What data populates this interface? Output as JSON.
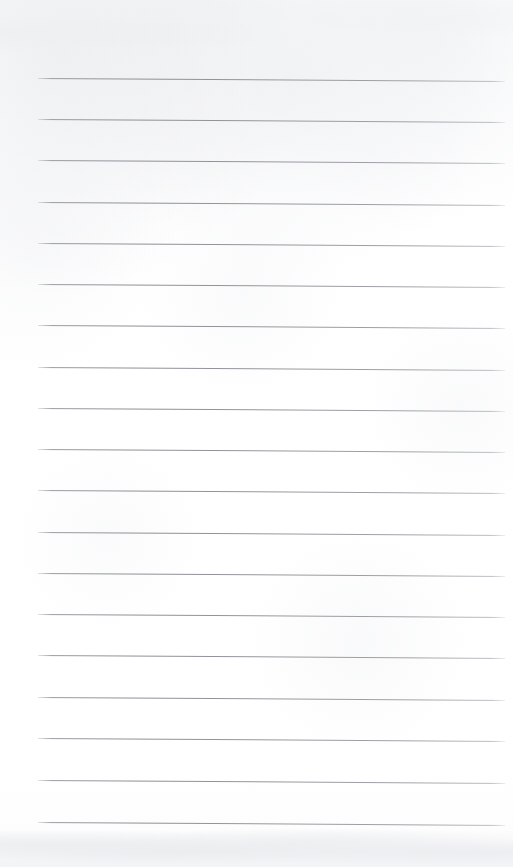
{
  "document": {
    "kind": "scanned-lined-paper",
    "title": "Blank lined notebook page",
    "text_content": "",
    "page_width": 513,
    "page_height": 867,
    "paper_color": "#fefefe",
    "rule_color": "#8d8f94",
    "bottom_band_color": "#f2f3f4"
  },
  "ruling": {
    "line_count": 19,
    "line_left_x": 38,
    "line_right_x": 505,
    "line_length": 467,
    "line_spacing": 41.3,
    "first_line_y": 78,
    "last_line_y": 822,
    "line_thickness": 1,
    "tilt_degrees": 0.36,
    "lines_y": [
      78,
      119,
      160,
      202,
      243,
      284,
      325,
      367,
      408,
      449,
      490,
      532,
      573,
      614,
      655,
      697,
      738,
      780,
      822
    ]
  },
  "margins": {
    "top_blank_height": 78,
    "left_margin": 38,
    "right_margin": 8,
    "bottom_blank_height": 45
  }
}
